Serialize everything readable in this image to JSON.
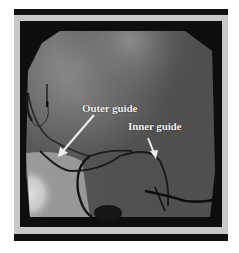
{
  "figure": {
    "annotations": [
      {
        "label": "Outer guide"
      },
      {
        "label": "Inner guide"
      }
    ],
    "colors": {
      "frame": "#c8c8c8",
      "bars": "#111111",
      "label_text": "#f4f4f4"
    }
  }
}
